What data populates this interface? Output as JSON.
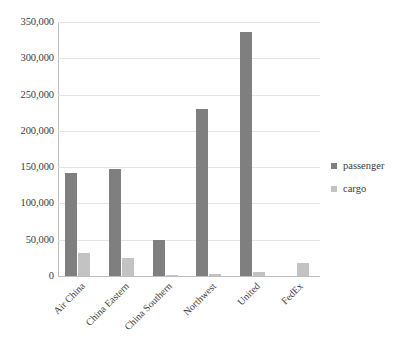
{
  "chart_data": {
    "type": "bar",
    "title": "",
    "subtitle": "",
    "xlabel": "",
    "ylabel": "",
    "grid": true,
    "legend_position": "right",
    "ylim": [
      0,
      350000
    ],
    "categories": [
      "Air China",
      "China Eastern",
      "China Southern",
      "Northwest",
      "United",
      "FedEx"
    ],
    "ytick_labels": [
      "350,000",
      "300,000",
      "250,000",
      "200,000",
      "150,000",
      "100,000",
      "50,000",
      "0"
    ],
    "ytick_values": [
      350000,
      300000,
      250000,
      200000,
      150000,
      100000,
      50000,
      0
    ],
    "series": [
      {
        "name": "passenger",
        "color": "#7f7f7f",
        "values": [
          142000,
          148000,
          50000,
          230000,
          336000,
          0
        ]
      },
      {
        "name": "cargo",
        "color": "#c3c3c3",
        "values": [
          32000,
          25000,
          2000,
          3000,
          5000,
          18000
        ]
      }
    ]
  },
  "legend": {
    "items": [
      {
        "label": "passenger",
        "color": "#7f7f7f"
      },
      {
        "label": "cargo",
        "color": "#c3c3c3"
      }
    ]
  }
}
